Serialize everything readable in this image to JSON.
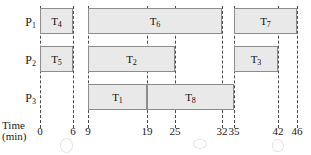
{
  "axis": {
    "caption_line1": "Time",
    "caption_line2": "(min)",
    "unit": "min",
    "ticks": [
      0,
      6,
      9,
      19,
      25,
      32,
      35,
      42,
      46
    ],
    "tick_labels": [
      "0",
      "6",
      "9",
      "19",
      "25",
      "32",
      "35",
      "42",
      "46"
    ],
    "tick_x": [
      40,
      73,
      88,
      147,
      175,
      222,
      234,
      278,
      297
    ]
  },
  "rows": [
    {
      "label": "P",
      "sub": "1",
      "name": "P1"
    },
    {
      "label": "P",
      "sub": "2",
      "name": "P2"
    },
    {
      "label": "P",
      "sub": "3",
      "name": "P3"
    }
  ],
  "chart_data": {
    "type": "bar",
    "title": "",
    "xlabel": "Time (min)",
    "ylabel": "",
    "categories": [
      "P1",
      "P2",
      "P3"
    ],
    "xlim": [
      0,
      46
    ],
    "grid": true,
    "legend": "none",
    "orientation": "horizontal",
    "axis_ticks": [
      0,
      6,
      9,
      19,
      25,
      32,
      35,
      42,
      46
    ],
    "series": [
      {
        "name": "P1",
        "tasks": [
          {
            "label": "T",
            "sub": "4",
            "task": "T4",
            "start": 0,
            "end": 6,
            "duration": 6
          },
          {
            "label": "T",
            "sub": "6",
            "task": "T6",
            "start": 9,
            "end": 32,
            "duration": 23
          },
          {
            "label": "T",
            "sub": "7",
            "task": "T7",
            "start": 35,
            "end": 46,
            "duration": 11
          }
        ]
      },
      {
        "name": "P2",
        "tasks": [
          {
            "label": "T",
            "sub": "5",
            "task": "T5",
            "start": 0,
            "end": 6,
            "duration": 6
          },
          {
            "label": "T",
            "sub": "2",
            "task": "T2",
            "start": 9,
            "end": 25,
            "duration": 16
          },
          {
            "label": "T",
            "sub": "3",
            "task": "T3",
            "start": 35,
            "end": 42,
            "duration": 7
          }
        ]
      },
      {
        "name": "P3",
        "tasks": [
          {
            "label": "T",
            "sub": "1",
            "task": "T1",
            "start": 9,
            "end": 19,
            "duration": 10
          },
          {
            "label": "T",
            "sub": "8",
            "task": "T8",
            "start": 19,
            "end": 35,
            "duration": 16
          }
        ]
      }
    ]
  },
  "colors": {
    "bar_fill": "#e9e9e9",
    "bar_border": "#8d8d8d",
    "gridline": "#4a4a4a",
    "text": "#1a1a1a",
    "background": "#ffffff"
  }
}
